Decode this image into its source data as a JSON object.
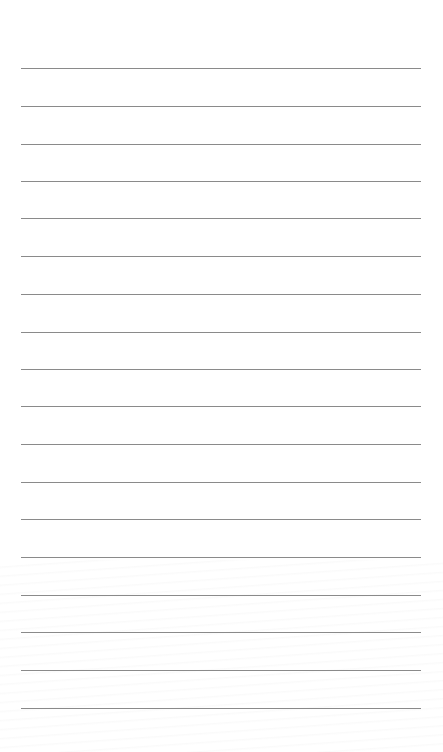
{
  "page": {
    "type": "lined-paper",
    "background_color": "#ffffff",
    "line_color": "#8a8a8a",
    "line_count": 18,
    "line_left": 21,
    "line_width": 400,
    "lines_y": [
      68,
      106,
      144,
      181,
      218,
      256,
      294,
      332,
      369,
      406,
      444,
      482,
      519,
      557,
      595,
      632,
      670,
      708
    ]
  }
}
